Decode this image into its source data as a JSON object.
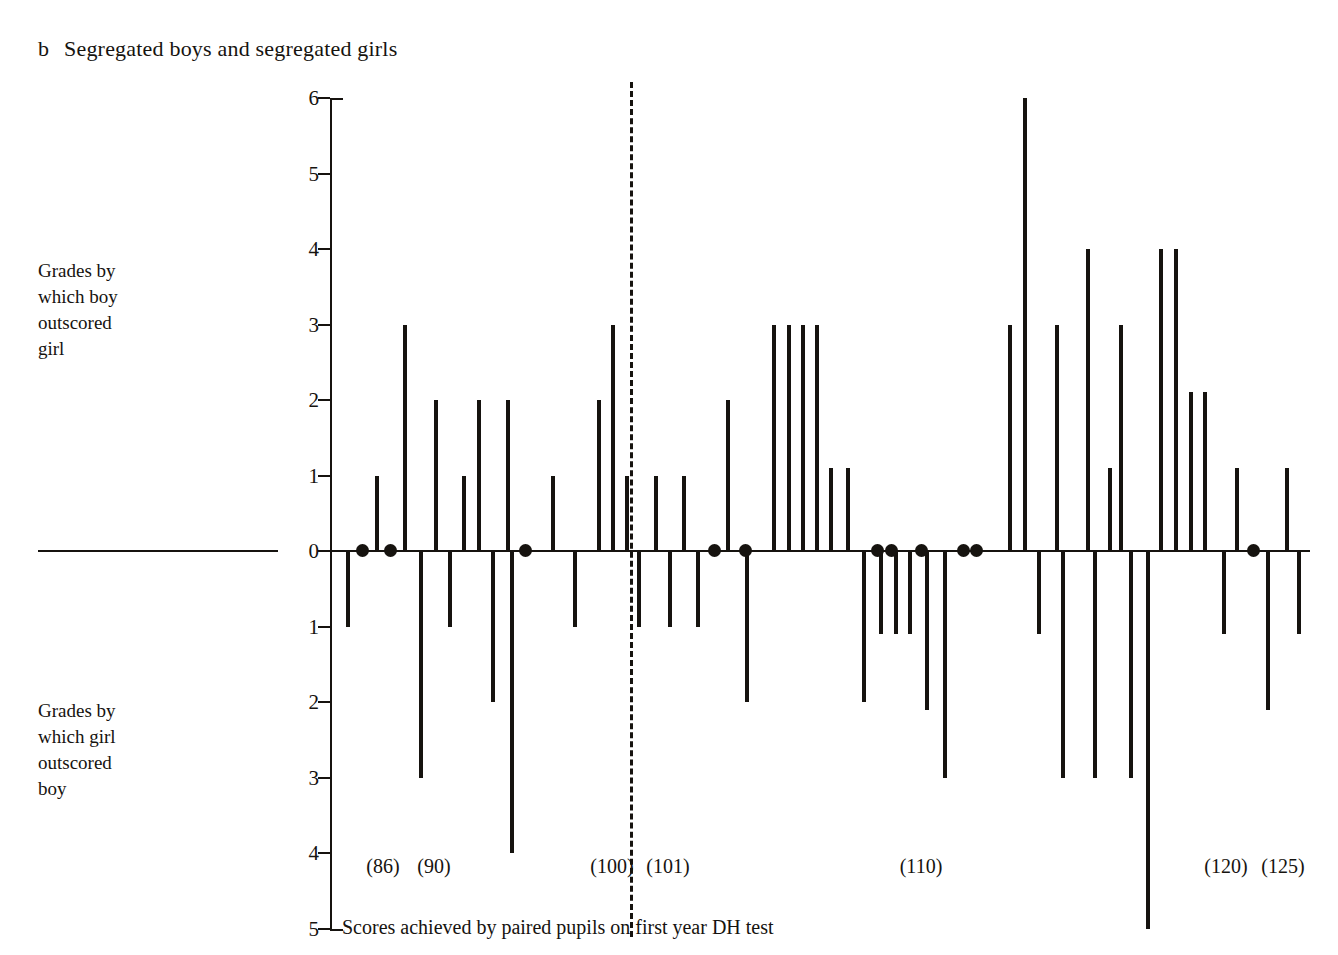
{
  "figure": {
    "panel_letter": "b",
    "panel_title": "Segregated boys and segregated girls",
    "upper_axis_label": [
      "Grades by",
      "which boy",
      "outscored",
      "girl"
    ],
    "lower_axis_label": [
      "Grades by",
      "which girl",
      "outscored",
      "boy"
    ],
    "x_caption": "Scores achieved by paired pupils on first year DH test",
    "ink_color": "#16130f",
    "background_color": "#ffffff"
  },
  "chart_data": {
    "type": "bar",
    "subtitle": "",
    "xlabel": "Scores achieved by paired pupils on first year DH test",
    "ylabel": "Grades by which boy outscored girl / Grades by which girl outscored boy",
    "ylim": [
      -5,
      6
    ],
    "grid": false,
    "legend": null,
    "y_tick_values": [
      6,
      5,
      4,
      3,
      2,
      1,
      0,
      -1,
      -2,
      -3,
      -4,
      -5
    ],
    "y_tick_labels": [
      "6",
      "5",
      "4",
      "3",
      "2",
      "1",
      "0",
      "1",
      "2",
      "3",
      "4",
      "5"
    ],
    "x_tick_labels": [
      "(86)",
      "(90)",
      "(100)",
      "(101)",
      "(110)",
      "(120)",
      "(125)"
    ],
    "x_tick_positions": [
      86,
      90,
      100,
      101,
      110,
      120,
      125
    ],
    "annotations": [
      {
        "type": "vertical-dashed-line",
        "x": 101.5,
        "note": "divider between lower and upper score groups"
      },
      {
        "type": "zero-rule",
        "y": 0,
        "note": "horizontal baseline extended left of the axis"
      },
      {
        "type": "marker",
        "shape": "filled-circle",
        "note": "filled dot marks a tied pair (zero difference)"
      }
    ],
    "categories": [
      "86a",
      "86b",
      "87",
      "88",
      "89",
      "90",
      "91",
      "92",
      "93",
      "94",
      "95",
      "96",
      "97",
      "98",
      "99a",
      "99b",
      "100a",
      "100b",
      "100c",
      "100d",
      "101a",
      "101b",
      "102",
      "103",
      "104",
      "105",
      "106",
      "107a",
      "107b",
      "107c",
      "107d",
      "108a",
      "108b",
      "109a",
      "109b",
      "110a",
      "110b",
      "110c",
      "110d",
      "111",
      "112a",
      "112b",
      "113a",
      "113b",
      "114",
      "115a",
      "115b",
      "116",
      "117a",
      "117b",
      "118a",
      "118b",
      "119",
      "120a",
      "120b",
      "120c",
      "121a",
      "121b",
      "122",
      "123",
      "124",
      "125a",
      "125b"
    ],
    "values": [
      -1,
      0,
      1,
      0,
      3,
      -3,
      2,
      -1,
      1,
      2,
      -2,
      2,
      -4,
      0,
      1,
      -1,
      2,
      3,
      1,
      -1,
      1,
      -1,
      1,
      -1,
      0,
      2,
      0,
      -2,
      3,
      3,
      3,
      3,
      1.1,
      1.1,
      -2,
      -1.1,
      0,
      -1.1,
      -1.1,
      0,
      -2.1,
      -3,
      0,
      0,
      3,
      6,
      -1.1,
      3,
      4,
      1.1,
      3,
      -3,
      -5,
      4,
      4,
      2.1,
      2.1,
      -3,
      1.1,
      -1.1,
      0,
      1.1,
      -2.1
    ],
    "values_note": "Positive = grades by which boy outscored girl; negative = grades by which girl outscored boy; 0 values are drawn as filled dots on the baseline."
  },
  "series_bars": [
    {
      "x": 346,
      "v": -1
    },
    {
      "x": 361,
      "v": 0
    },
    {
      "x": 375,
      "v": 1
    },
    {
      "x": 389,
      "v": 0
    },
    {
      "x": 403,
      "v": 3
    },
    {
      "x": 419,
      "v": -3
    },
    {
      "x": 434,
      "v": 2
    },
    {
      "x": 448,
      "v": -1
    },
    {
      "x": 462,
      "v": 1
    },
    {
      "x": 477,
      "v": 2
    },
    {
      "x": 491,
      "v": -2
    },
    {
      "x": 506,
      "v": 2
    },
    {
      "x": 510,
      "v": -4
    },
    {
      "x": 524,
      "v": 0
    },
    {
      "x": 551,
      "v": 1
    },
    {
      "x": 573,
      "v": -1
    },
    {
      "x": 597,
      "v": 2
    },
    {
      "x": 611,
      "v": 3
    },
    {
      "x": 625,
      "v": 1
    },
    {
      "x": 637,
      "v": -1
    },
    {
      "x": 654,
      "v": 1
    },
    {
      "x": 668,
      "v": -1
    },
    {
      "x": 682,
      "v": 1
    },
    {
      "x": 696,
      "v": -1
    },
    {
      "x": 713,
      "v": 0
    },
    {
      "x": 726,
      "v": 2
    },
    {
      "x": 744,
      "v": 0
    },
    {
      "x": 745,
      "v": -2
    },
    {
      "x": 772,
      "v": 3
    },
    {
      "x": 787,
      "v": 3
    },
    {
      "x": 801,
      "v": 3
    },
    {
      "x": 815,
      "v": 3
    },
    {
      "x": 829,
      "v": 1.1
    },
    {
      "x": 846,
      "v": 1.1
    },
    {
      "x": 862,
      "v": -2
    },
    {
      "x": 876,
      "v": 0
    },
    {
      "x": 879,
      "v": -1.1
    },
    {
      "x": 890,
      "v": 0
    },
    {
      "x": 894,
      "v": -1.1
    },
    {
      "x": 908,
      "v": -1.1
    },
    {
      "x": 920,
      "v": 0
    },
    {
      "x": 925,
      "v": -2.1
    },
    {
      "x": 943,
      "v": -3
    },
    {
      "x": 962,
      "v": 0
    },
    {
      "x": 975,
      "v": 0
    },
    {
      "x": 1008,
      "v": 3
    },
    {
      "x": 1023,
      "v": 6
    },
    {
      "x": 1037,
      "v": -1.1
    },
    {
      "x": 1055,
      "v": 3
    },
    {
      "x": 1061,
      "v": -3
    },
    {
      "x": 1086,
      "v": 4
    },
    {
      "x": 1093,
      "v": -3
    },
    {
      "x": 1108,
      "v": 1.1
    },
    {
      "x": 1119,
      "v": 3
    },
    {
      "x": 1129,
      "v": -3
    },
    {
      "x": 1146,
      "v": -5
    },
    {
      "x": 1159,
      "v": 4
    },
    {
      "x": 1174,
      "v": 4
    },
    {
      "x": 1189,
      "v": 2.1
    },
    {
      "x": 1203,
      "v": 2.1
    },
    {
      "x": 1222,
      "v": -1.1
    },
    {
      "x": 1235,
      "v": 1.1
    },
    {
      "x": 1252,
      "v": 0
    },
    {
      "x": 1266,
      "v": -2.1
    },
    {
      "x": 1285,
      "v": 1.1
    },
    {
      "x": 1297,
      "v": -1.1
    }
  ],
  "zero_dots_x": [
    361,
    389,
    524,
    713,
    744,
    876,
    890,
    920,
    962,
    975,
    1252
  ],
  "x_tick_labels_positioned": [
    {
      "label": "(86)",
      "x": 383
    },
    {
      "label": "(90)",
      "x": 434
    },
    {
      "label": "(100)",
      "x": 612
    },
    {
      "label": "(101)",
      "x": 668
    },
    {
      "label": "(110)",
      "x": 921
    },
    {
      "label": "(120)",
      "x": 1226
    },
    {
      "label": "(125)",
      "x": 1283
    }
  ]
}
